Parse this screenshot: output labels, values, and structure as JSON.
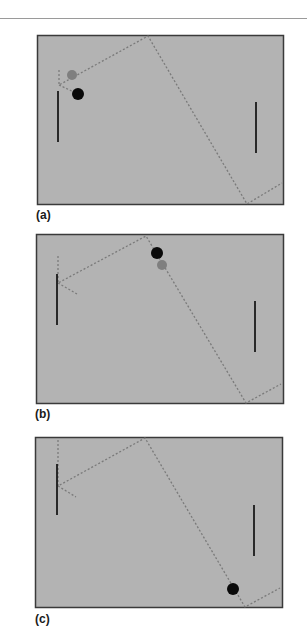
{
  "colors": {
    "field": "#b3b3b3",
    "frame": "#3a3a3a",
    "paddle": "#1a1a1a",
    "trajectory": "#7a7a7a",
    "ball_current": "#0a0a0a",
    "ball_ghost": "#7f7f7f"
  },
  "panels": [
    {
      "label": "(a)",
      "frame": {
        "x": 37,
        "y": 35,
        "w": 246,
        "h": 169
      },
      "left_paddle": {
        "x": 58,
        "y1": 91,
        "y2": 142
      },
      "right_paddle": {
        "x": 256,
        "y1": 102,
        "y2": 153
      },
      "trajectory": [
        [
          59,
          70
        ],
        [
          59,
          85
        ],
        [
          148,
          36
        ],
        [
          247,
          204
        ],
        [
          282,
          183
        ]
      ],
      "trajectory_branch": [
        [
          59,
          85
        ],
        [
          78,
          94
        ]
      ],
      "ghost_ball": {
        "cx": 72,
        "cy": 75,
        "r": 5
      },
      "ball": {
        "cx": 78,
        "cy": 94,
        "r": 6
      },
      "label_pos": {
        "x": 36,
        "y": 208
      }
    },
    {
      "label": "(b)",
      "frame": {
        "x": 36,
        "y": 234,
        "w": 247,
        "h": 169
      },
      "left_paddle": {
        "x": 57,
        "y1": 274,
        "y2": 325
      },
      "right_paddle": {
        "x": 255,
        "y1": 301,
        "y2": 352
      },
      "trajectory": [
        [
          58,
          256
        ],
        [
          58,
          283
        ],
        [
          146,
          236
        ],
        [
          246,
          403
        ],
        [
          281,
          384
        ]
      ],
      "trajectory_branch": [
        [
          58,
          283
        ],
        [
          77,
          294
        ]
      ],
      "ghost_ball": {
        "cx": 162,
        "cy": 265,
        "r": 5
      },
      "ball": {
        "cx": 157,
        "cy": 253,
        "r": 6
      },
      "label_pos": {
        "x": 35,
        "y": 407
      }
    },
    {
      "label": "(c)",
      "frame": {
        "x": 35,
        "y": 437,
        "w": 247,
        "h": 170
      },
      "left_paddle": {
        "x": 57,
        "y1": 464,
        "y2": 515
      },
      "right_paddle": {
        "x": 254,
        "y1": 505,
        "y2": 556
      },
      "trajectory": [
        [
          58,
          440
        ],
        [
          58,
          486
        ],
        [
          145,
          438
        ],
        [
          245,
          607
        ],
        [
          280,
          588
        ]
      ],
      "trajectory_branch": [
        [
          58,
          486
        ],
        [
          76,
          497
        ]
      ],
      "ghost_ball": null,
      "ball": {
        "cx": 233,
        "cy": 589,
        "r": 6
      },
      "label_pos": {
        "x": 35,
        "y": 612
      }
    }
  ]
}
